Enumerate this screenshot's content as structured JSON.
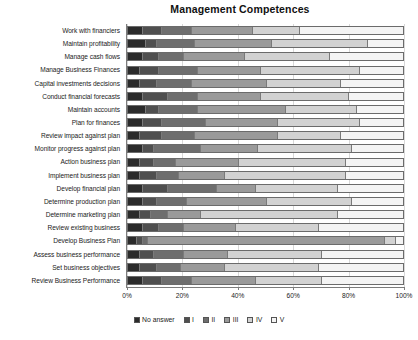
{
  "chart_data": {
    "type": "bar",
    "orientation": "horizontal",
    "stacked": true,
    "stack_mode": "percent",
    "title": "Management Competences",
    "xlabel": "",
    "ylabel": "",
    "xlim": [
      0,
      100
    ],
    "xticks": [
      "0%",
      "20%",
      "40%",
      "60%",
      "80%",
      "100%"
    ],
    "xtick_values": [
      0,
      20,
      40,
      60,
      80,
      100
    ],
    "grid": true,
    "legend_position": "bottom",
    "legend": [
      "No answer",
      "I",
      "II",
      "III",
      "IV",
      "V"
    ],
    "colors": [
      "#2b2b2b",
      "#4f4f4f",
      "#6e6e6e",
      "#9a9a9a",
      "#d2d2d2",
      "#f4f4f4"
    ],
    "categories": [
      "Work with financiers",
      "Maintain profitability",
      "Manage cash flows",
      "Manage Business Finances",
      "Capital investments decisions",
      "Conduct financial forecasts",
      "Maintain accounts",
      "Plan for finances",
      "Review impact against plan",
      "Monitor progress against plan",
      "Action business plan",
      "Implement business plan",
      "Develop financial plan",
      "Determine production plan",
      "Determine marketing plan",
      "Review existing business",
      "Develop Business Plan",
      "Assess business performance",
      "Set business objectives",
      "Review Business Performance"
    ],
    "series": [
      {
        "name": "No answer",
        "values": [
          5,
          6,
          5,
          4,
          4,
          5,
          6,
          5,
          4,
          5,
          4,
          4,
          5,
          5,
          4,
          5,
          3,
          4,
          4,
          5
        ]
      },
      {
        "name": "I",
        "values": [
          7,
          4,
          6,
          7,
          6,
          9,
          5,
          7,
          8,
          4,
          5,
          6,
          9,
          5,
          4,
          6,
          2,
          5,
          6,
          7
        ]
      },
      {
        "name": "II",
        "values": [
          11,
          14,
          9,
          14,
          13,
          11,
          14,
          16,
          12,
          17,
          8,
          8,
          18,
          11,
          6,
          9,
          2,
          11,
          9,
          11
        ]
      },
      {
        "name": "III",
        "values": [
          22,
          28,
          22,
          23,
          27,
          23,
          32,
          26,
          30,
          21,
          23,
          17,
          14,
          29,
          12,
          19,
          86,
          16,
          16,
          23
        ]
      },
      {
        "name": "IV",
        "values": [
          17,
          35,
          31,
          36,
          27,
          32,
          26,
          30,
          23,
          34,
          39,
          44,
          30,
          31,
          50,
          30,
          4,
          34,
          34,
          24
        ]
      },
      {
        "name": "V",
        "values": [
          38,
          13,
          27,
          16,
          23,
          20,
          17,
          16,
          23,
          19,
          21,
          21,
          24,
          19,
          24,
          31,
          3,
          30,
          31,
          30
        ]
      }
    ]
  }
}
